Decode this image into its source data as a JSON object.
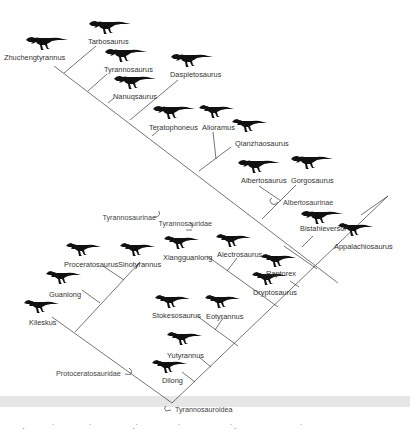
{
  "figure": {
    "taxa": [
      {
        "name": "Zhuchengtyrannus",
        "x": 4,
        "y": 54
      },
      {
        "name": "Tarbosaurus",
        "x": 88,
        "y": 38
      },
      {
        "name": "Tyrannosaurus",
        "x": 104,
        "y": 66
      },
      {
        "name": "Nanuqsaurus",
        "x": 113,
        "y": 93
      },
      {
        "name": "Daspletosaurus",
        "x": 170,
        "y": 71
      },
      {
        "name": "Teratophoneus",
        "x": 149,
        "y": 124
      },
      {
        "name": "Alioramus",
        "x": 202,
        "y": 124
      },
      {
        "name": "Qianzhaosaurus",
        "x": 235,
        "y": 140
      },
      {
        "name": "Albertosaurus",
        "x": 241,
        "y": 177
      },
      {
        "name": "Gorgosaurus",
        "x": 291,
        "y": 177
      },
      {
        "name": "Bistahieversor",
        "x": 300,
        "y": 225
      },
      {
        "name": "Appalachiosaurus",
        "x": 334,
        "y": 243
      },
      {
        "name": "Proceratosaurus",
        "x": 64,
        "y": 261
      },
      {
        "name": "Sinotyrannus",
        "x": 118,
        "y": 261
      },
      {
        "name": "Xiangguanlong",
        "x": 163,
        "y": 254
      },
      {
        "name": "Alectrosaurus",
        "x": 217,
        "y": 251
      },
      {
        "name": "Raptorex",
        "x": 266,
        "y": 270
      },
      {
        "name": "Dryptosaurus",
        "x": 253,
        "y": 289
      },
      {
        "name": "Guanlong",
        "x": 49,
        "y": 291
      },
      {
        "name": "Kileskus",
        "x": 29,
        "y": 319
      },
      {
        "name": "Stokesosaurus",
        "x": 152,
        "y": 312
      },
      {
        "name": "Eotyrannus",
        "x": 206,
        "y": 313
      },
      {
        "name": "Yutyrannus",
        "x": 167,
        "y": 352
      },
      {
        "name": "Dilong",
        "x": 162,
        "y": 377
      }
    ],
    "clades": [
      {
        "name": "Tyrannosaurinae",
        "x": 156,
        "y": 216
      },
      {
        "name": "Albertosaurinae",
        "x": 283,
        "y": 199
      },
      {
        "name": "Tyrannosauridae",
        "x": 212,
        "y": 220
      },
      {
        "name": "Protoceratosauridae",
        "x": 56,
        "y": 370
      },
      {
        "name": "Tyrannosauroidea",
        "x": 175,
        "y": 406
      }
    ],
    "caption_fragment": [
      "·",
      "˙",
      "˙",
      "·˙",
      "˙",
      "˙·",
      "˙"
    ]
  },
  "colors": {
    "line": "#3a3a3a",
    "silhouette": "#111111",
    "band": "#e6e6e6",
    "text": "#333333"
  }
}
